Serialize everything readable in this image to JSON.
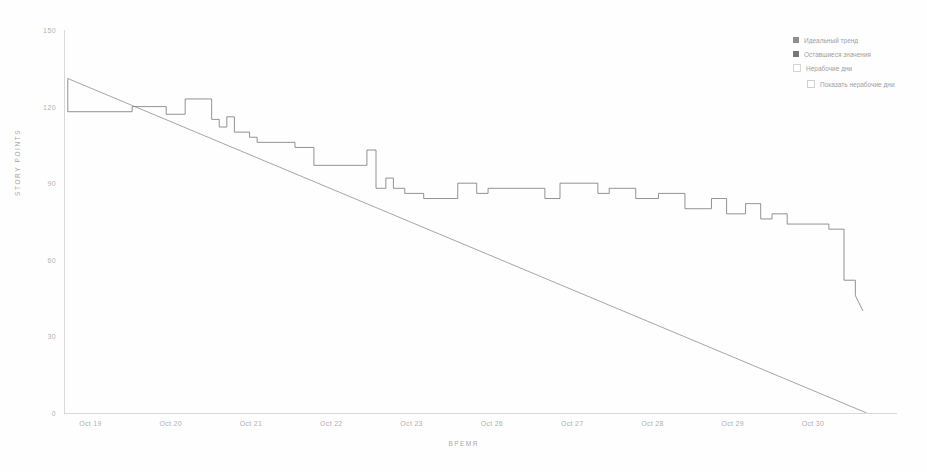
{
  "chart_data": {
    "type": "line",
    "title": "",
    "xlabel": "ВРЕМЯ",
    "ylabel": "STORY POINTS",
    "xlim": [
      0,
      11
    ],
    "ylim": [
      0,
      150
    ],
    "grid": false,
    "legend_position": "top-right",
    "categories": [
      "Oct 19",
      "Oct 20",
      "Oct 21",
      "Oct 22",
      "Oct 23",
      "Oct 26",
      "Oct 27",
      "Oct 28",
      "Oct 29",
      "Oct 30"
    ],
    "ytick_labels": [
      "150",
      "120",
      "90",
      "60",
      "30",
      "0"
    ],
    "ytick_values": [
      150,
      120,
      90,
      60,
      30,
      0
    ],
    "xtick_labels": [
      "Oct 19",
      "Oct 20",
      "Oct 21",
      "Oct 22",
      "Oct 23",
      "Oct 26",
      "Oct 27",
      "Oct 28",
      "Oct 29",
      "Oct 30"
    ],
    "series": [
      {
        "name": "Идеальный тренд",
        "type": "guideline",
        "color": "#8f8f8f",
        "x": [
          0.05,
          10.6
        ],
        "values": [
          131,
          0
        ]
      },
      {
        "name": "Оставшиеся значения",
        "type": "step",
        "color": "#777777",
        "x": [
          0.05,
          0.05,
          0.9,
          0.9,
          1.35,
          1.35,
          1.6,
          1.6,
          1.95,
          1.95,
          2.05,
          2.05,
          2.15,
          2.15,
          2.25,
          2.25,
          2.45,
          2.45,
          2.55,
          2.55,
          3.05,
          3.05,
          3.3,
          3.3,
          4.0,
          4.0,
          4.12,
          4.12,
          4.25,
          4.25,
          4.35,
          4.35,
          4.5,
          4.5,
          4.75,
          4.75,
          5.2,
          5.2,
          5.45,
          5.45,
          5.6,
          5.6,
          6.35,
          6.35,
          6.55,
          6.55,
          7.05,
          7.05,
          7.2,
          7.2,
          7.55,
          7.55,
          7.85,
          7.85,
          8.2,
          8.2,
          8.55,
          8.55,
          8.75,
          8.75,
          9.0,
          9.0,
          9.2,
          9.2,
          9.35,
          9.35,
          9.55,
          9.55,
          10.1,
          10.1,
          10.3,
          10.3,
          10.45,
          10.45,
          10.55
        ],
        "values": [
          131,
          118,
          118,
          120,
          120,
          117,
          117,
          123,
          123,
          115,
          115,
          112,
          112,
          116,
          116,
          110,
          110,
          108,
          108,
          106,
          106,
          104,
          104,
          97,
          97,
          103,
          103,
          88,
          88,
          92,
          92,
          88,
          88,
          86,
          86,
          84,
          84,
          90,
          90,
          86,
          86,
          88,
          88,
          84,
          84,
          90,
          90,
          86,
          86,
          88,
          88,
          84,
          84,
          86,
          86,
          80,
          80,
          84,
          84,
          78,
          78,
          82,
          82,
          76,
          76,
          78,
          78,
          74,
          74,
          72,
          72,
          52,
          52,
          46,
          40
        ]
      }
    ]
  },
  "legend": {
    "items": [
      {
        "label": "Идеальный тренд",
        "swatch": "sw-guideline"
      },
      {
        "label": "Оставшиеся значения",
        "swatch": "sw-remaining"
      },
      {
        "label": "Нерабочие дни",
        "swatch": "sw-nonwork"
      }
    ],
    "checkbox": {
      "label": "Показать нерабочие дни",
      "checked": false
    }
  }
}
